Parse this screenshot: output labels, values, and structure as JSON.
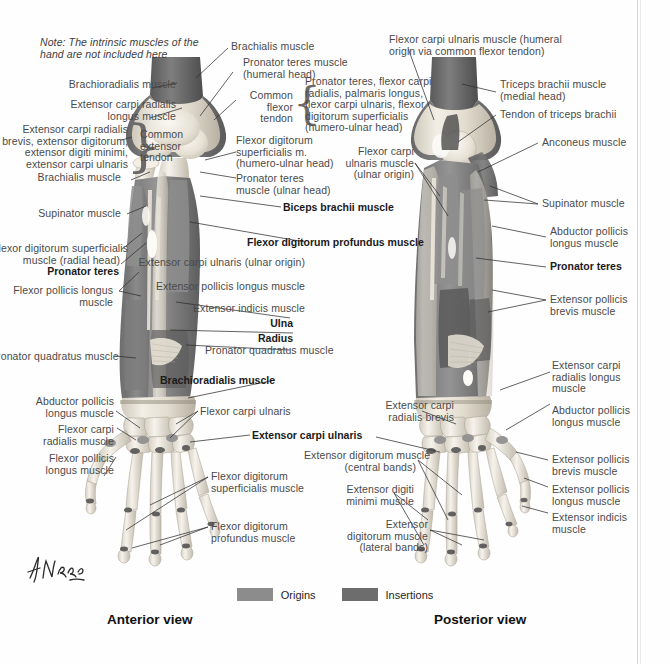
{
  "plate": {
    "note": "Note: The intrinsic muscles of the\nhand are not included here",
    "signature_alt": "F. Netter signature"
  },
  "legend": {
    "origins_label": "Origins",
    "insertions_label": "Insertions",
    "origins_color": "#8c8c8c",
    "insertions_color": "#6d6d6d"
  },
  "views": {
    "anterior": "Anterior view",
    "posterior": "Posterior view"
  },
  "braces": {
    "common_flexor_tendon": "Common\nflexor\ntendon",
    "common_extensor_tendon": "Common\nextensor\ntendon"
  },
  "anterior_labels": {
    "brachioradialis": "Brachioradialis muscle",
    "ecr_longus": "Extensor carpi radialis\nlongus muscle",
    "common_extensor_group": "Extensor carpi radialis\nbrevis, extensor digitorum,\nextensor digiti minimi,\nextensor carpi ulnaris",
    "brachialis": "Brachialis muscle",
    "supinator": "Supinator muscle",
    "fds_radial_head": "Flexor digitorum superficialis\nmuscle (radial head)",
    "pronator_teres": "Pronator teres",
    "flexor_pollicis_longus": "Flexor pollicis longus\nmuscle",
    "pronator_quadratus": "Pronator quadratus muscle",
    "abductor_pollicis_longus": "Abductor pollicis\nlongus muscle",
    "flexor_carpi_radialis": "Flexor carpi\nradialis muscle",
    "flexor_pollicis_longus_hand": "Flexor pollicis\nlongus muscle",
    "brachialis_top": "Brachialis muscle",
    "pronator_teres_humeral": "Pronator teres muscle\n(humeral head)",
    "fds_humero_ulnar": "Flexor digitorum\nsuperficialis m.\n(humero-ulnar head)",
    "pronator_teres_ulnar": "Pronator teres\nmuscle (ulnar head)",
    "biceps_brachii": "Biceps brachii muscle",
    "fdp": "Flexor digitorum profundus muscle",
    "ecu_ulnar_origin": "Extensor carpi ulnaris (ulnar origin)",
    "epl": "Extensor pollicis longus muscle",
    "extensor_indicis": "Extensor indicis muscle",
    "ulna": "Ulna",
    "radius": "Radius",
    "pronator_quadratus_2": "Pronator quadratus muscle",
    "brachioradialis_2": "Brachioradialis muscle",
    "flexor_carpi_ulnaris": "Flexor carpi ulnaris",
    "extensor_carpi_ulnaris": "Extensor carpi ulnaris",
    "fds_hand": "Flexor digitorum\nsuperficialis muscle",
    "fdp_hand": "Flexor digitorum\nprofundus muscle"
  },
  "posterior_labels": {
    "fcu_humeral": "Flexor carpi ulnaris muscle (humeral\norigin via common flexor tendon)",
    "common_flexor_group": "Pronator teres, flexor carpi\nradialis, palmaris longus,\nflexor carpi ulnaris, flexor\ndigitorum superficialis\n(humero-ulnar head)",
    "triceps_medial": "Triceps brachii muscle\n(medial head)",
    "triceps_tendon": "Tendon of triceps brachii",
    "anconeus": "Anconeus muscle",
    "fcu_ulnar": "Flexor carpi\nulnaris muscle\n(ulnar origin)",
    "supinator": "Supinator muscle",
    "abductor_pollicis_longus": "Abductor pollicis\nlongus muscle",
    "pronator_teres": "Pronator teres",
    "extensor_pollicis_brevis": "Extensor pollicis\nbrevis muscle",
    "ecr_longus": "Extensor carpi\nradialis longus\nmuscle",
    "ecr_brevis": "Extensor carpi\nradialis brevis",
    "abductor_pollicis_longus_2": "Abductor pollicis\nlongus muscle",
    "extensor_pollicis_brevis_2": "Extensor pollicis\nbrevis muscle",
    "extensor_pollicis_longus": "Extensor pollicis\nlongus muscle",
    "extensor_indicis": "Extensor indicis\nmuscle",
    "ed_central": "Extensor digitorum muscle\n(central bands)",
    "edm": "Extensor digiti\nminimi muscle",
    "ed_lateral": "Extensor\ndigitorum muscle\n(lateral bands)"
  }
}
